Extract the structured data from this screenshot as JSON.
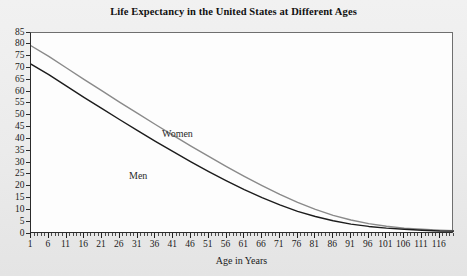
{
  "chart_data": {
    "type": "line",
    "title": "Life Expectancy in the United States at Different Ages",
    "xlabel": "Age in Years",
    "ylabel": "",
    "xlim": [
      1,
      120
    ],
    "ylim": [
      0,
      85
    ],
    "grid": false,
    "legend_position": "inline-annotation",
    "y_ticks": [
      0,
      5,
      10,
      15,
      20,
      25,
      30,
      35,
      40,
      45,
      50,
      55,
      60,
      65,
      70,
      75,
      80,
      85
    ],
    "x_ticks": [
      1,
      6,
      11,
      16,
      21,
      26,
      31,
      36,
      41,
      46,
      51,
      56,
      61,
      66,
      71,
      76,
      81,
      86,
      91,
      96,
      101,
      106,
      111,
      116
    ],
    "x_tick_minor_step": 1,
    "annotations": [
      {
        "text": "Women",
        "x": 26,
        "y": 52
      },
      {
        "text": "Men",
        "x": 18,
        "y": 38
      }
    ],
    "x": [
      1,
      6,
      11,
      16,
      21,
      26,
      31,
      36,
      41,
      46,
      51,
      56,
      61,
      66,
      71,
      76,
      81,
      86,
      91,
      96,
      101,
      106,
      111,
      116,
      120
    ],
    "series": [
      {
        "name": "Women",
        "color": "#8a8a8a",
        "values": [
          79.6,
          75.1,
          70.2,
          65.3,
          60.5,
          55.7,
          51.0,
          46.3,
          41.7,
          37.2,
          32.8,
          28.5,
          24.4,
          20.5,
          16.8,
          13.4,
          10.4,
          7.9,
          5.9,
          4.4,
          3.3,
          2.5,
          2.0,
          1.6,
          1.4
        ]
      },
      {
        "name": "Men",
        "color": "#1c1c1c",
        "values": [
          71.8,
          67.4,
          62.5,
          57.7,
          53.0,
          48.3,
          43.7,
          39.2,
          34.8,
          30.5,
          26.4,
          22.5,
          18.8,
          15.4,
          12.3,
          9.6,
          7.4,
          5.6,
          4.2,
          3.2,
          2.5,
          2.0,
          1.6,
          1.3,
          1.2
        ]
      }
    ]
  }
}
